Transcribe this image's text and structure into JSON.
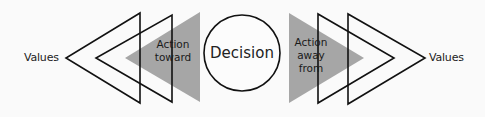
{
  "diagram": {
    "left_label": "Values",
    "right_label": "Values",
    "center_label": "Decision",
    "left_action": {
      "line1": "Action",
      "line2": "toward"
    },
    "right_action": {
      "line1": "Action",
      "line2": "away",
      "line3": "from"
    },
    "colors": {
      "background": "#fafafa",
      "stroke": "#111111",
      "gray_fill": "#a6a6a6",
      "text": "#222222"
    }
  }
}
